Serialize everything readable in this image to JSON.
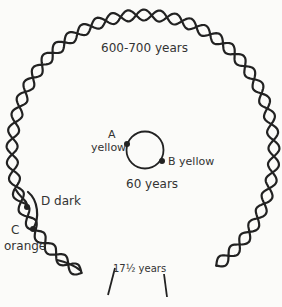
{
  "diagram": {
    "outer_cycle_label": "600-700 years",
    "inner_cycle_label": "60 years",
    "bottom_label": "17½ years",
    "points": [
      {
        "id": "A",
        "letter": "A",
        "color": "yellow"
      },
      {
        "id": "B",
        "letter": "B",
        "color": "yellow"
      },
      {
        "id": "C",
        "letter": "C",
        "color": "orange"
      },
      {
        "id": "D",
        "letter": "D",
        "color": "dark"
      }
    ],
    "b_label": "B yellow",
    "d_label": "D dark",
    "colors": {
      "line": "#222222",
      "background": "#fbfbf9",
      "text": "#333333"
    }
  }
}
